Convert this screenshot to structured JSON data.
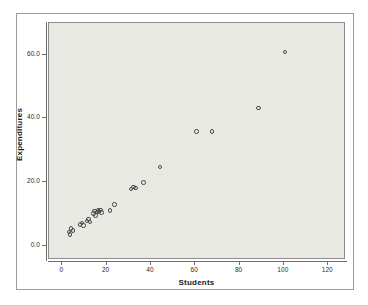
{
  "chart_data": {
    "type": "scatter",
    "title": "",
    "xlabel": "Students",
    "ylabel": "Expenditures",
    "xlim": [
      -6,
      128
    ],
    "ylim": [
      -4.5,
      70
    ],
    "grid": false,
    "legend": null,
    "xticks": [
      0,
      20,
      40,
      60,
      80,
      100,
      120
    ],
    "xticklabels": [
      "0",
      "20",
      "40",
      "60",
      "80",
      "100",
      "120"
    ],
    "yticks": [
      0,
      20,
      40,
      60
    ],
    "yticklabels": [
      "0.0",
      "20.0",
      "40.0",
      "60.0"
    ],
    "marker": "open-circle",
    "marker_color": "#4a4a4a",
    "plot_background": "#e9e9e4",
    "figure_background": "#ffffff",
    "points": [
      {
        "x": 3.5,
        "y": 4.0
      },
      {
        "x": 4.0,
        "y": 3.2
      },
      {
        "x": 4.5,
        "y": 5.1
      },
      {
        "x": 5.2,
        "y": 4.4
      },
      {
        "x": 8.5,
        "y": 6.3
      },
      {
        "x": 9.3,
        "y": 6.9
      },
      {
        "x": 10.0,
        "y": 6.0
      },
      {
        "x": 11.5,
        "y": 7.5
      },
      {
        "x": 12.2,
        "y": 8.1
      },
      {
        "x": 13.0,
        "y": 7.2
      },
      {
        "x": 14.5,
        "y": 9.8
      },
      {
        "x": 15.0,
        "y": 10.6
      },
      {
        "x": 15.4,
        "y": 9.2
      },
      {
        "x": 16.0,
        "y": 10.2
      },
      {
        "x": 16.5,
        "y": 11.0
      },
      {
        "x": 17.0,
        "y": 10.4
      },
      {
        "x": 17.6,
        "y": 10.9
      },
      {
        "x": 18.2,
        "y": 10.1
      },
      {
        "x": 22.0,
        "y": 10.8
      },
      {
        "x": 24.0,
        "y": 12.6
      },
      {
        "x": 31.5,
        "y": 17.6
      },
      {
        "x": 32.5,
        "y": 18.2
      },
      {
        "x": 33.5,
        "y": 17.8
      },
      {
        "x": 37.0,
        "y": 19.6
      },
      {
        "x": 44.5,
        "y": 24.5
      },
      {
        "x": 61.0,
        "y": 35.6
      },
      {
        "x": 68.0,
        "y": 35.6
      },
      {
        "x": 89.0,
        "y": 43.0
      },
      {
        "x": 101.0,
        "y": 60.5
      }
    ]
  }
}
